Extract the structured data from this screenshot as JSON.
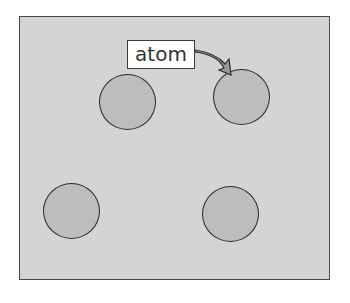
{
  "diagram": {
    "label": "atom",
    "atoms": [
      {
        "name": "atom-top-left",
        "cx": 127,
        "cy": 102,
        "r": 28
      },
      {
        "name": "atom-top-right",
        "cx": 241,
        "cy": 96,
        "r": 28
      },
      {
        "name": "atom-bottom-left",
        "cx": 72,
        "cy": 210,
        "r": 28
      },
      {
        "name": "atom-bottom-right",
        "cx": 231,
        "cy": 214,
        "r": 28
      }
    ],
    "colors": {
      "background": "#d4d4d4",
      "atom_fill": "#bdbdbd",
      "arrow_fill": "#9a9a9a"
    }
  }
}
